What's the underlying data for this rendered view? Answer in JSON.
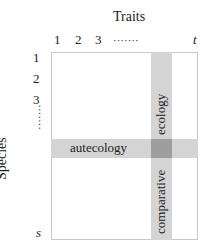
{
  "title": "Traits",
  "y_axis_label": "Species",
  "columns": {
    "labels": [
      "1",
      "2",
      "3",
      "·······",
      "t"
    ]
  },
  "rows": {
    "labels": [
      "1",
      "2",
      "3",
      "·······",
      "s"
    ]
  },
  "bands": {
    "horizontal": {
      "label": "autecology"
    },
    "vertical_top": {
      "label": "ecology"
    },
    "vertical_bottom": {
      "label": "comparative"
    }
  },
  "colors": {
    "band": "#d4d4d4",
    "intersection": "#9e9e9e",
    "border": "#c8c8c8"
  }
}
